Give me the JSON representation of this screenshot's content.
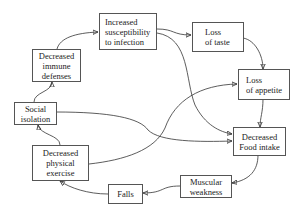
{
  "diagram": {
    "nodes": [
      {
        "id": "immune",
        "label": "Decreased immune defenses",
        "lines": [
          "Decreased",
          "immune",
          "defenses"
        ]
      },
      {
        "id": "susceptibility",
        "label": "Increased susceptibility to infection",
        "lines": [
          "Increased",
          "susceptibility",
          "to infection"
        ]
      },
      {
        "id": "taste",
        "label": "Loss of taste",
        "lines": [
          "Loss",
          "of taste"
        ]
      },
      {
        "id": "appetite",
        "label": "Loss of appetite",
        "lines": [
          "Loss",
          "of appetite"
        ]
      },
      {
        "id": "social",
        "label": "Social isolation",
        "lines": [
          "Social",
          "isolation"
        ]
      },
      {
        "id": "food",
        "label": "Decreased Food intake",
        "lines": [
          "Decreased",
          "Food intake"
        ]
      },
      {
        "id": "exercise",
        "label": "Decreased physical exercise",
        "lines": [
          "Decreased",
          "physical",
          "exercise"
        ]
      },
      {
        "id": "muscular",
        "label": "Muscular weakness",
        "lines": [
          "Muscular",
          "weakness"
        ]
      },
      {
        "id": "falls",
        "label": "Falls",
        "lines": [
          "Falls"
        ]
      }
    ],
    "edges": [
      {
        "from": "social",
        "to": "immune"
      },
      {
        "from": "immune",
        "to": "susceptibility"
      },
      {
        "from": "susceptibility",
        "to": "taste"
      },
      {
        "from": "susceptibility",
        "to": "food"
      },
      {
        "from": "taste",
        "to": "appetite"
      },
      {
        "from": "appetite",
        "to": "food"
      },
      {
        "from": "social",
        "to": "food"
      },
      {
        "from": "exercise",
        "to": "appetite"
      },
      {
        "from": "exercise",
        "to": "social"
      },
      {
        "from": "food",
        "to": "muscular"
      },
      {
        "from": "muscular",
        "to": "falls"
      },
      {
        "from": "falls",
        "to": "exercise"
      }
    ]
  }
}
